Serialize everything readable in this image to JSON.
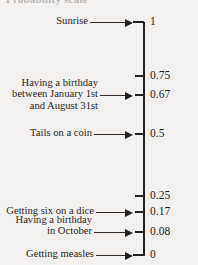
{
  "figure": {
    "heading_remnant": "Probability scale",
    "type": "probability-scale-number-line",
    "axis": {
      "top_value": "1",
      "bottom_value": "0",
      "orientation": "vertical"
    }
  },
  "ticks": [
    {
      "label": "1",
      "value": 1,
      "y": 22,
      "style": "corner-top"
    },
    {
      "label": "0.75",
      "value": 0.75,
      "y": 76,
      "style": "short"
    },
    {
      "label": "0.67",
      "value": 0.67,
      "y": 95,
      "style": "short"
    },
    {
      "label": "0.5",
      "value": 0.5,
      "y": 134,
      "style": "short"
    },
    {
      "label": "0.25",
      "value": 0.25,
      "y": 196,
      "style": "short"
    },
    {
      "label": "0.17",
      "value": 0.17,
      "y": 212,
      "style": "short"
    },
    {
      "label": "0.08",
      "value": 0.08,
      "y": 232,
      "style": "short"
    },
    {
      "label": "0",
      "value": 0,
      "y": 255,
      "style": "corner-bottom"
    }
  ],
  "events": [
    {
      "name": "sunrise",
      "lines": [
        "Sunrise"
      ],
      "points_to_value": 1,
      "points_to_label": "1"
    },
    {
      "name": "birthday-jan-to-aug",
      "lines": [
        "Having a birthday",
        "between January 1st",
        "and August 31st"
      ],
      "points_to_value": 0.67,
      "points_to_label": "0.67"
    },
    {
      "name": "tails-on-a-coin",
      "lines": [
        "Tails on a coin"
      ],
      "points_to_value": 0.5,
      "points_to_label": "0.5"
    },
    {
      "name": "getting-six-on-a-dice",
      "lines": [
        "Getting six on a dice"
      ],
      "points_to_value": 0.17,
      "points_to_label": "0.17"
    },
    {
      "name": "birthday-in-october",
      "lines": [
        "Having a birthday",
        "in October"
      ],
      "points_to_value": 0.08,
      "points_to_label": "0.08"
    },
    {
      "name": "getting-measles",
      "lines": [
        "Getting measles"
      ],
      "points_to_value": 0,
      "points_to_label": "0"
    }
  ],
  "colors": {
    "background": "#f2f1ef",
    "ink": "#23211f",
    "text": "#2a2724"
  }
}
